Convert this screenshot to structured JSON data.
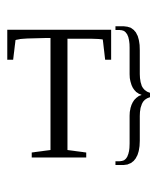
{
  "glyphs": {
    "letter": "T",
    "brace": "}"
  },
  "colors": {
    "foreground": "#000000",
    "background": "#ffffff"
  }
}
